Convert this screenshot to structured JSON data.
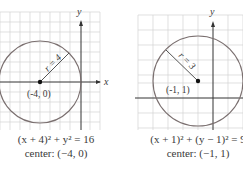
{
  "colors": {
    "grid": "#cfcfcf",
    "axis": "#333333",
    "circle": "#7a6f6f",
    "text": "#3a3a3a",
    "background": "#ffffff"
  },
  "graphs": [
    {
      "axis_labels": {
        "x": "x",
        "y": "y"
      },
      "center_label": "(-4, 0)",
      "radius_label": "r = 4",
      "equation": "(x + 4)² + y² = 16",
      "center_caption": "center: (−4, 0)"
    },
    {
      "axis_labels": {
        "y": "y"
      },
      "center_label": "(-1, 1)",
      "radius_label": "r = 3",
      "equation": "(x + 1)² + (y − 1)² = 9",
      "center_caption": "center: (−1, 1)"
    }
  ]
}
